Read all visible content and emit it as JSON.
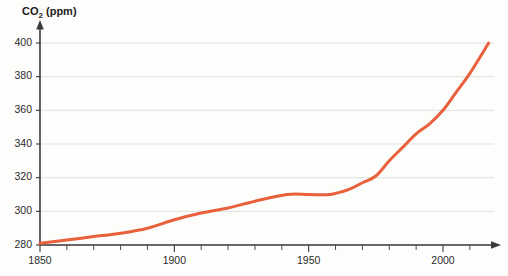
{
  "chart_data": {
    "type": "line",
    "title": "CO2 (ppm)",
    "title_main": "CO",
    "title_sub": "2",
    "title_unit": " (ppm)",
    "xlabel": "",
    "ylabel": "CO2 (ppm)",
    "xlim": [
      1850,
      2017
    ],
    "ylim": [
      278,
      404
    ],
    "grid": true,
    "legend": "none",
    "x_ticks": [
      1850,
      1900,
      1950,
      2000
    ],
    "x_tick_labels": [
      "1850",
      "1900",
      "1950",
      "2000"
    ],
    "x_minor_tick_step": 10,
    "y_ticks": [
      280,
      300,
      320,
      340,
      360,
      380,
      400
    ],
    "y_tick_labels": [
      "280",
      "300",
      "320",
      "340",
      "360",
      "380",
      "400"
    ],
    "series": [
      {
        "name": "Atmospheric CO2 concentration",
        "color": "#e8603c",
        "x": [
          1850,
          1860,
          1870,
          1880,
          1890,
          1900,
          1910,
          1920,
          1930,
          1942,
          1950,
          1958,
          1965,
          1970,
          1975,
          1980,
          1985,
          1990,
          1995,
          2000,
          2005,
          2010,
          2017
        ],
        "values": [
          281,
          283,
          285,
          287,
          290,
          295,
          299,
          302,
          306,
          310,
          310,
          310,
          313,
          317,
          321,
          330,
          338,
          346,
          352,
          360,
          371,
          382,
          400
        ]
      }
    ]
  },
  "colors": {
    "line": "#e8603c",
    "grid": "#d9d9d9",
    "axis": "#3a3a3a",
    "text": "#1a1a1a",
    "background": "#fdfdfc"
  }
}
